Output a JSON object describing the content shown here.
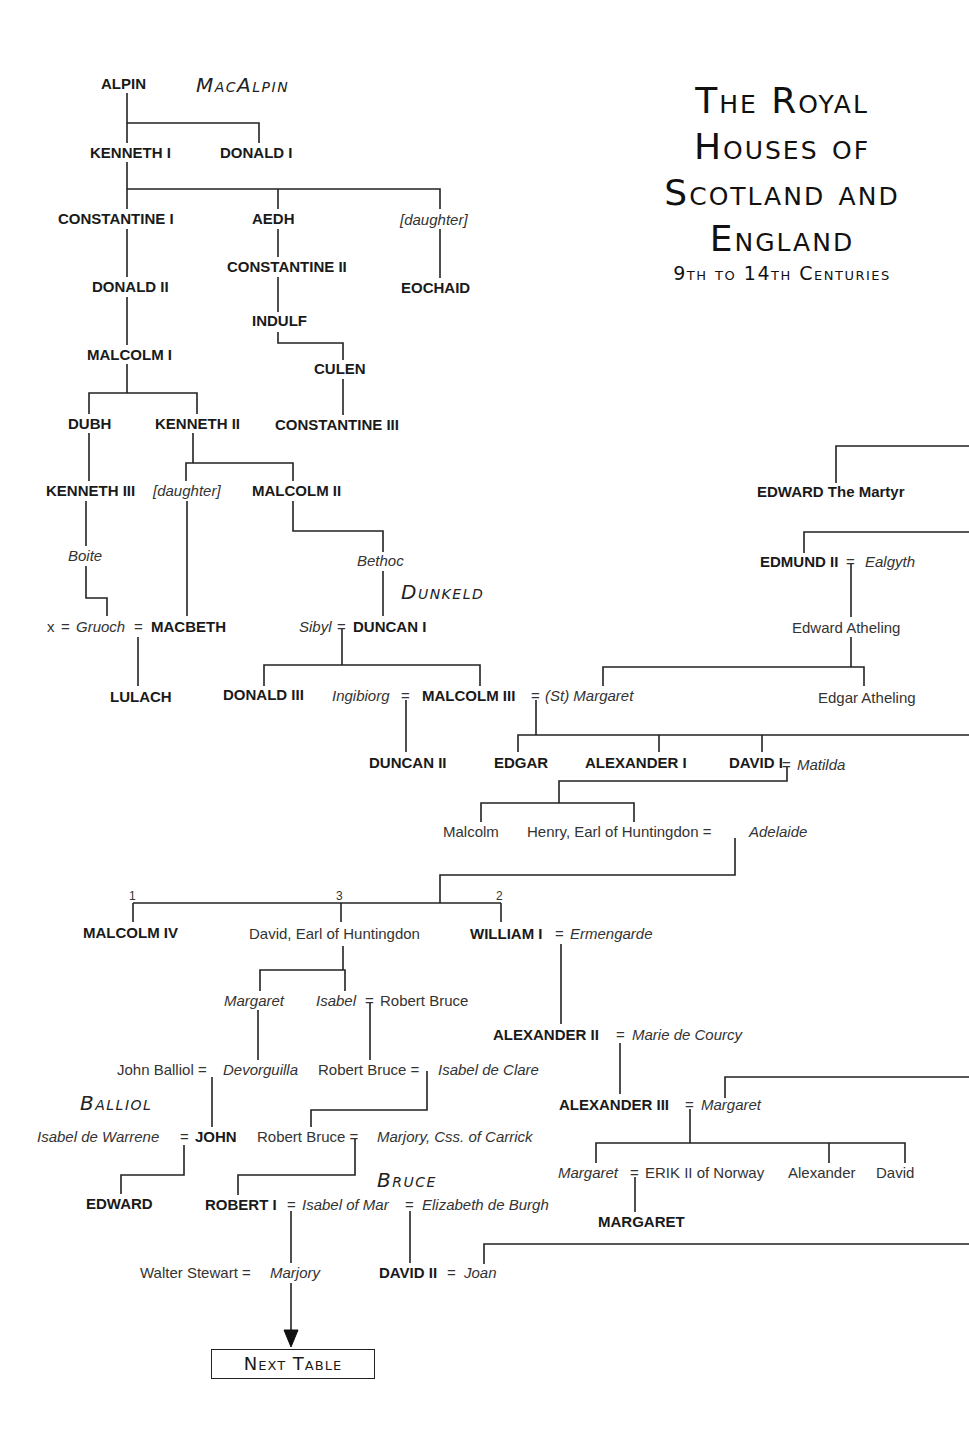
{
  "title": {
    "line1": "The Royal",
    "line2": "Houses of",
    "line3": "Scotland and",
    "line4": "England",
    "subtitle": "9th to 14th Centuries"
  },
  "houses": {
    "macalpin": "MacAlpin",
    "dunkeld": "Dunkeld",
    "balliol": "Balliol",
    "bruce": "Bruce"
  },
  "people": {
    "alpin": "ALPIN",
    "kenneth_i": "KENNETH I",
    "donald_i": "DONALD I",
    "constantine_i": "CONSTANTINE I",
    "aedh": "AEDH",
    "daughter_1": "[daughter]",
    "constantine_ii": "CONSTANTINE II",
    "donald_ii": "DONALD II",
    "eochaid": "EOCHAID",
    "indulf": "INDULF",
    "malcolm_i": "MALCOLM I",
    "culen": "CULEN",
    "dubh": "DUBH",
    "kenneth_ii": "KENNETH II",
    "constantine_iii": "CONSTANTINE III",
    "kenneth_iii": "KENNETH III",
    "daughter_2": "[daughter]",
    "malcolm_ii": "MALCOLM II",
    "boite": "Boite",
    "bethoc": "Bethoc",
    "x": "x",
    "eq": "=",
    "gruoch": "Gruoch",
    "macbeth": "MACBETH",
    "sibyl": "Sibyl",
    "duncan_i": "DUNCAN I",
    "lulach": "LULACH",
    "donald_iii": "DONALD III",
    "ingibiorg": "Ingibiorg",
    "malcolm_iii": "MALCOLM III",
    "st_margaret": "(St) Margaret",
    "duncan_ii": "DUNCAN II",
    "edgar": "EDGAR",
    "alexander_i": "ALEXANDER I",
    "david_i": "DAVID I",
    "matilda": "Matilda",
    "malcolm": "Malcolm",
    "henry": "Henry, Earl of Huntingdon =",
    "adelaide": "Adelaide",
    "malcolm_iv": "MALCOLM IV",
    "david_earl": "David, Earl of Huntingdon",
    "william_i": "WILLIAM I",
    "ermengarde": "Ermengarde",
    "margaret_d": "Margaret",
    "isabel": "Isabel",
    "robert_bruce_1": "Robert Bruce",
    "alexander_ii": "ALEXANDER II",
    "marie": "Marie de Courcy",
    "john_balliol": "John Balliol =",
    "devorguilla": "Devorguilla",
    "robert_bruce_2": "Robert Bruce =",
    "isabel_clare": "Isabel de Clare",
    "alexander_iii": "ALEXANDER III",
    "margaret_w": "Margaret",
    "isabel_warrene": "Isabel de Warrene",
    "john": "JOHN",
    "robert_bruce_3": "Robert Bruce =",
    "marjory_carrick": "Marjory, Css. of Carrick",
    "margaret_n": "Margaret",
    "erik": "ERIK II of Norway",
    "alexander": "Alexander",
    "david": "David",
    "edward": "EDWARD",
    "robert_i": "ROBERT I",
    "isabel_mar": "Isabel of Mar",
    "elizabeth": "Elizabeth de Burgh",
    "margaret_maid": "MARGARET",
    "walter": "Walter Stewart =",
    "marjory": "Marjory",
    "david_ii": "DAVID II",
    "joan": "Joan",
    "edward_martyr": "EDWARD The Martyr",
    "edmund_ii": "EDMUND II",
    "ealgyth": "Ealgyth",
    "edward_atheling": "Edward Atheling",
    "edgar_atheling": "Edgar Atheling"
  },
  "birth_order": {
    "one": "1",
    "two": "2",
    "three": "3"
  },
  "next_table": "Next Table"
}
